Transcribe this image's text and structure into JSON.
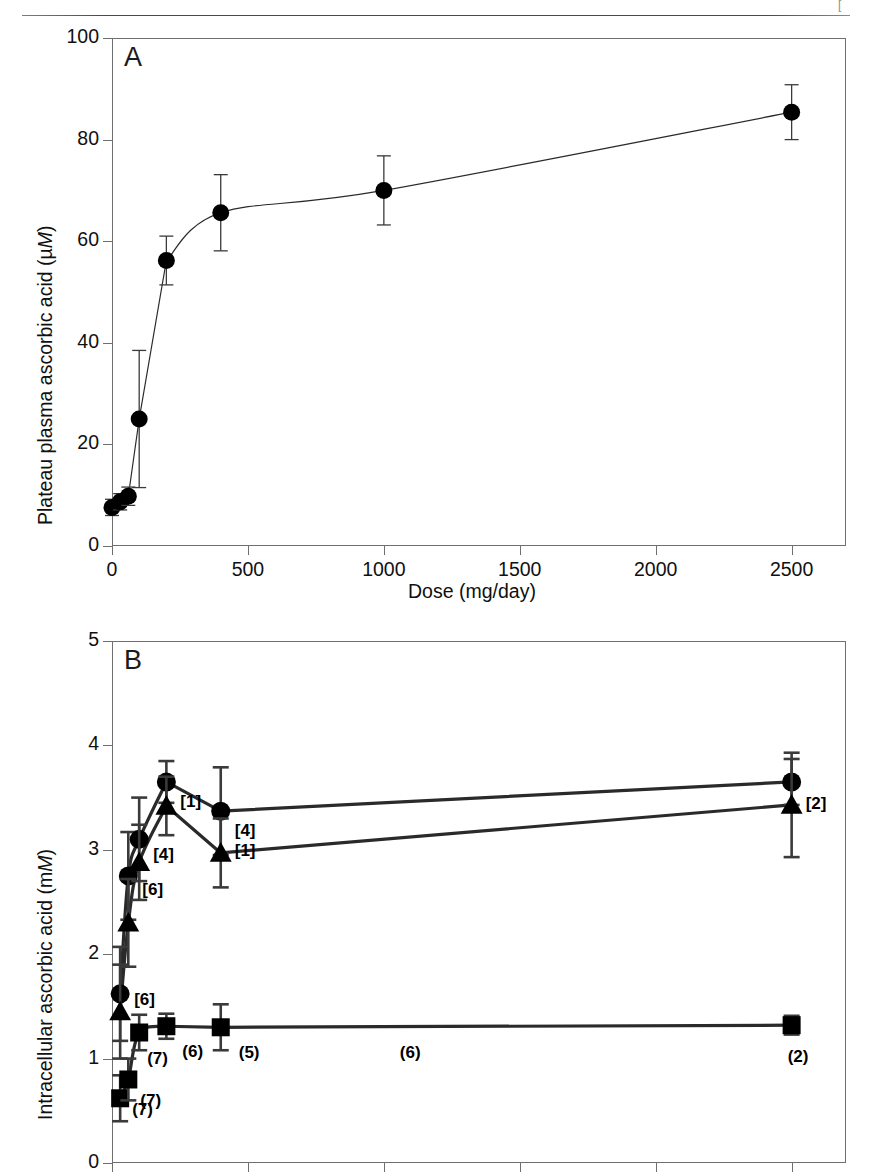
{
  "page": {
    "header_left": "",
    "header_center": "",
    "header_right": "["
  },
  "panels": [
    {
      "letter": "A",
      "name": "panel-a"
    },
    {
      "letter": "B",
      "name": "panel-b"
    }
  ],
  "chart_data": [
    {
      "type": "scatter",
      "panel": "A",
      "title": "A",
      "xlabel": "Dose (mg/day)",
      "ylabel": "Plateau plasma ascorbic acid (µM)",
      "ylabel_unit_italic": "M",
      "ylabel_prefix": "Plateau plasma ascorbic acid (µ",
      "ylabel_suffix": ")",
      "xlim": [
        0,
        2700
      ],
      "ylim": [
        0,
        100
      ],
      "xticks": [
        0,
        500,
        1000,
        1500,
        2000,
        2500
      ],
      "xticklabels": [
        "0",
        "500",
        "1000",
        "1500",
        "2000",
        "2500"
      ],
      "yticks": [
        0,
        20,
        40,
        60,
        80,
        100
      ],
      "yticklabels": [
        "0",
        "20",
        "40",
        "60",
        "80",
        "100"
      ],
      "grid": false,
      "legend": "none",
      "series": [
        {
          "name": "plateau-plasma-ascorbic-acid",
          "marker": "circle",
          "x": [
            0,
            30,
            60,
            100,
            200,
            400,
            1000,
            2500
          ],
          "y": [
            7.6,
            8.7,
            9.8,
            25.0,
            56.2,
            65.6,
            70.0,
            77.0
          ],
          "yerr": [
            1.6,
            1.6,
            1.8,
            13.5,
            4.8,
            7.5,
            6.8,
            5.3
          ]
        }
      ],
      "points": [
        {
          "x": 0,
          "y": 7.6,
          "yerr": 1.6
        },
        {
          "x": 30,
          "y": 8.7,
          "yerr": 1.6
        },
        {
          "x": 60,
          "y": 9.8,
          "yerr": 1.8
        },
        {
          "x": 100,
          "y": 25.0,
          "yerr": 13.5
        },
        {
          "x": 200,
          "y": 56.2,
          "yerr": 4.8
        },
        {
          "x": 400,
          "y": 65.6,
          "yerr": 7.5
        },
        {
          "x": 1000,
          "y": 70.0,
          "yerr": 6.8
        },
        {
          "x": 2500,
          "y": 85.4,
          "yerr": 5.4
        }
      ]
    },
    {
      "type": "scatter",
      "panel": "B",
      "title": "B",
      "xlabel": "",
      "ylabel": "Intracellular ascorbic acid (mM)",
      "ylabel_unit_italic": "M",
      "ylabel_prefix": "Intracellular ascorbic acid (m",
      "ylabel_suffix": ")",
      "xlim": [
        0,
        2700
      ],
      "ylim": [
        0,
        5
      ],
      "xticks": [
        0,
        500,
        1000,
        1500,
        2000,
        2500
      ],
      "xticklabels": [
        "",
        "",
        "",
        "",
        "",
        ""
      ],
      "yticks": [
        0,
        1,
        2,
        3,
        4,
        5
      ],
      "yticklabels": [
        "0",
        "1",
        "2",
        "3",
        "4",
        "5"
      ],
      "grid": false,
      "legend": "none",
      "series": [
        {
          "name": "neutrophils",
          "marker": "circle",
          "x": [
            30,
            60,
            100,
            200,
            400,
            2500
          ],
          "y": [
            1.62,
            2.75,
            3.1,
            3.65,
            3.37,
            3.65
          ],
          "yerr": [
            0.45,
            0.42,
            0.4,
            0.2,
            0.42,
            0.22
          ]
        },
        {
          "name": "monocytes",
          "marker": "triangle",
          "x": [
            30,
            60,
            100,
            200,
            400,
            2500
          ],
          "y": [
            1.45,
            2.3,
            2.88,
            3.42,
            2.97,
            3.43
          ],
          "yerr": [
            0.45,
            0.42,
            0.36,
            0.28,
            0.33,
            0.5
          ]
        },
        {
          "name": "lymphocytes",
          "marker": "square",
          "x": [
            30,
            60,
            100,
            200,
            400,
            2500
          ],
          "y": [
            0.62,
            0.8,
            1.25,
            1.31,
            1.3,
            1.32
          ],
          "yerr": [
            0.22,
            0.2,
            0.17,
            0.12,
            0.22,
            0.09
          ]
        }
      ],
      "annotations": [
        {
          "text": "[6]",
          "series": "neutrophils",
          "x": 30,
          "y": 1.62
        },
        {
          "text": "[6]",
          "series": "neutrophils",
          "x": 60,
          "y": 2.75
        },
        {
          "text": "[4]",
          "series": "neutrophils",
          "x": 100,
          "y": 3.1
        },
        {
          "text": "[1]",
          "series": "neutrophils",
          "x": 200,
          "y": 3.65
        },
        {
          "text": "[1]",
          "series": "neutrophils",
          "x": 400,
          "y": 3.1
        },
        {
          "text": "[4]",
          "series": "neutrophils",
          "x": 400,
          "y": 3.37
        },
        {
          "text": "[2]",
          "series": "neutrophils",
          "x": 2500,
          "y": 3.65
        },
        {
          "text": "(7)",
          "series": "lymphocytes",
          "x": 30,
          "y": 0.62
        },
        {
          "text": "(7)",
          "series": "lymphocytes",
          "x": 60,
          "y": 0.8
        },
        {
          "text": "(7)",
          "series": "lymphocytes",
          "x": 100,
          "y": 1.25
        },
        {
          "text": "(6)",
          "series": "lymphocytes",
          "x": 200,
          "y": 1.31
        },
        {
          "text": "(5)",
          "series": "lymphocytes",
          "x": 400,
          "y": 1.3
        },
        {
          "text": "(6)",
          "series": "lymphocytes",
          "x": 1000,
          "y": 1.3
        },
        {
          "text": "(2)",
          "series": "lymphocytes",
          "x": 2500,
          "y": 1.32
        }
      ]
    }
  ],
  "panelA": {
    "letter": "A",
    "ylabel_prefix": "Plateau plasma ascorbic acid (µ",
    "ylabel_italic": "M",
    "ylabel_suffix": ")",
    "xlabel": "Dose (mg/day)"
  },
  "panelB": {
    "letter": "B",
    "ylabel_prefix": "Intracellular ascorbic acid (m",
    "ylabel_italic": "M",
    "ylabel_suffix": ")"
  }
}
